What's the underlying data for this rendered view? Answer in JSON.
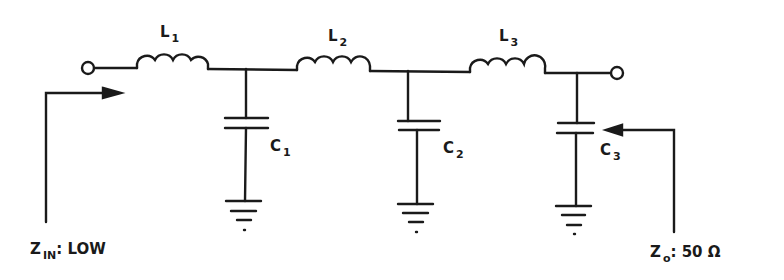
{
  "diagram": {
    "type": "low-pass LC ladder filter schematic",
    "stroke_color": "#1a1a1a",
    "background": "#ffffff",
    "inductors": [
      {
        "label": "L",
        "sub": "1"
      },
      {
        "label": "L",
        "sub": "2"
      },
      {
        "label": "L",
        "sub": "3"
      }
    ],
    "capacitors": [
      {
        "label": "C",
        "sub": "1"
      },
      {
        "label": "C",
        "sub": "2"
      },
      {
        "label": "C",
        "sub": "3"
      }
    ],
    "input": {
      "label": "Z",
      "sub": "IN",
      "value": ": LOW"
    },
    "output": {
      "label": "Z",
      "sub": "o",
      "value": ":  50 Ω"
    }
  }
}
